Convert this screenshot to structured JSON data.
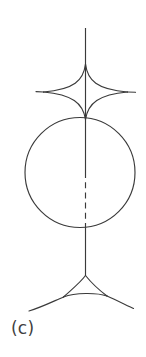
{
  "figure": {
    "label": "(c)",
    "caption_position": "bottom-left",
    "background_color": "#ffffff",
    "stroke_color": "#3a3a3a",
    "stroke_width": 1.15,
    "canvas": {
      "width": 146,
      "height": 357
    },
    "elements": {
      "top_axis_line": {
        "name": "vertical-axis-upper",
        "style": "solid",
        "x": 85.5,
        "y_start": 28,
        "y_end": 118
      },
      "astroid": {
        "name": "four-cusped-star",
        "center_x": 85.5,
        "center_y": 92,
        "radius_x": 42,
        "radius_y": 28,
        "cusps": 4,
        "cusp_points": [
          {
            "x": 85.5,
            "y": 64
          },
          {
            "x": 127.5,
            "y": 92
          },
          {
            "x": 85.5,
            "y": 120
          },
          {
            "x": 43.5,
            "y": 92
          }
        ],
        "arm_extension_left_x": 36,
        "arm_extension_right_x": 135
      },
      "circle": {
        "name": "middle-circle",
        "center_x": 80,
        "center_y": 172.5,
        "radius": 55,
        "top_y": 117.5,
        "bottom_y": 227.5,
        "left_x": 25,
        "right_x": 135
      },
      "mid_axis_solid": {
        "name": "vertical-axis-middle-solid",
        "style": "solid",
        "x": 85.5,
        "y_start": 118,
        "y_end": 172
      },
      "mid_axis_dashed": {
        "name": "vertical-axis-middle-dashed",
        "style": "dashed",
        "x": 85.5,
        "y_start": 172,
        "y_end": 228,
        "dash_length": 6,
        "gap_length": 4.2
      },
      "lower_axis_line": {
        "name": "vertical-axis-lower",
        "style": "solid",
        "x": 85.5,
        "y_start": 228,
        "y_end": 275
      },
      "deltoid": {
        "name": "three-cusped-deltoid",
        "center_x": 85.5,
        "center_y": 287,
        "radius": 20,
        "cusps": 3,
        "orientation": "apex-up",
        "cusp_points": [
          {
            "x": 85.5,
            "y": 275
          },
          {
            "x": 63.5,
            "y": 297
          },
          {
            "x": 107,
            "y": 296
          }
        ],
        "arm_end_left": {
          "x": 29,
          "y": 311
        },
        "arm_end_right": {
          "x": 133,
          "y": 308
        }
      }
    }
  }
}
